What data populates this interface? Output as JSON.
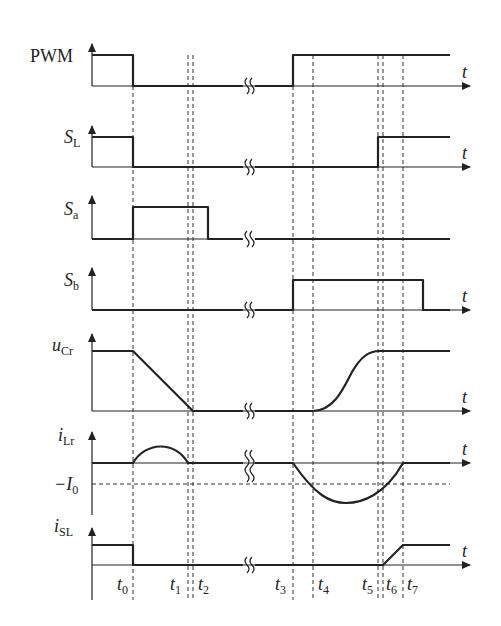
{
  "diagram": {
    "time_axis_label": "t",
    "time_markers": [
      {
        "name": "t0",
        "base": "t",
        "sub": "0"
      },
      {
        "name": "t1",
        "base": "t",
        "sub": "1"
      },
      {
        "name": "t2",
        "base": "t",
        "sub": "2"
      },
      {
        "name": "t3",
        "base": "t",
        "sub": "3"
      },
      {
        "name": "t4",
        "base": "t",
        "sub": "4"
      },
      {
        "name": "t5",
        "base": "t",
        "sub": "5"
      },
      {
        "name": "t6",
        "base": "t",
        "sub": "6"
      },
      {
        "name": "t7",
        "base": "t",
        "sub": "7"
      }
    ],
    "signals": [
      {
        "id": "pwm",
        "label": "PWM",
        "label_italic": false,
        "sub": "",
        "description": "High before t0, low t0–t3, high after t3"
      },
      {
        "id": "sl",
        "label": "S",
        "label_italic": true,
        "sub": "L",
        "description": "High before t0, low t0–t5, high after t5"
      },
      {
        "id": "sa",
        "label": "S",
        "label_italic": true,
        "sub": "a",
        "description": "High from t0 until just after t2"
      },
      {
        "id": "sb",
        "label": "S",
        "label_italic": true,
        "sub": "b",
        "description": "High from t3 until after t7"
      },
      {
        "id": "ucr",
        "label": "u",
        "label_italic": true,
        "sub": "Cr",
        "description": "High until t0, ramps down to zero by t1/t2, stays zero, rises from t4 to t5, then high"
      },
      {
        "id": "ilr",
        "label": "i",
        "label_italic": true,
        "sub": "Lr",
        "description": "Zero level, positive half-sine t0–t1, zero, negative half-sine t3–t7 crossing −I0 near t4 and t6"
      },
      {
        "id": "isl",
        "label": "i",
        "label_italic": true,
        "sub": "SL",
        "description": "High before t0, zero t0–t6, ramps up t6–t7, then constant"
      }
    ],
    "reference_level": {
      "label": "−I",
      "sub": "0"
    },
    "break_symbol": "≀≀"
  }
}
